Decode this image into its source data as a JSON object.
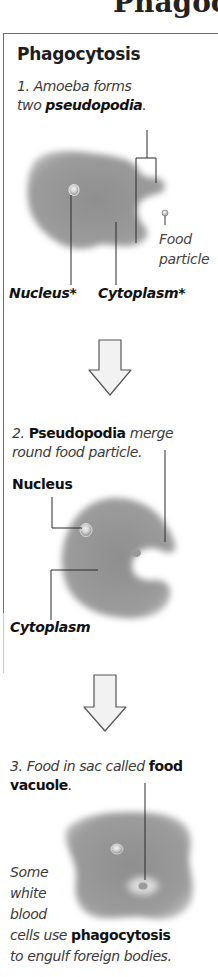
{
  "page": {
    "title_fragment": "Phagocyt"
  },
  "panel": {
    "heading": "Phagocytosis",
    "steps": [
      {
        "number": "1.",
        "text_line1": "Amoeba forms",
        "text_line2_prefix": "two ",
        "text_line2_bold": "pseudopodia",
        "text_line2_suffix": ".",
        "labels": {
          "nucleus": "Nucleus*",
          "cytoplasm": "Cytoplasm*",
          "food_line1": "Food",
          "food_line2": "particle"
        }
      },
      {
        "number": "2.",
        "text_bold": "Pseudopodia",
        "text_line1_suffix": " merge",
        "text_line2": "round food particle.",
        "labels": {
          "nucleus": "Nucleus",
          "cytoplasm": "Cytoplasm"
        }
      },
      {
        "number": "3.",
        "text_line1_prefix": "Food in sac called ",
        "text_line1_bold": "food",
        "text_line2_bold": "vacuole",
        "text_line2_suffix": "."
      }
    ],
    "note": {
      "line1": "Some",
      "line2": "white",
      "line3": "blood",
      "line4_prefix": "cells use ",
      "line4_bold": "phagocytosis",
      "line5": "to engulf foreign bodies."
    },
    "arrows": [
      {
        "icon": "down-arrow-icon"
      },
      {
        "icon": "down-arrow-icon"
      }
    ],
    "colors": {
      "cell_fill": "#9a9a9a",
      "cell_edge": "#c4c4c4",
      "border": "#6d6d6d",
      "arrow_fill": "#f2f2f2",
      "arrow_stroke": "#555555"
    }
  }
}
